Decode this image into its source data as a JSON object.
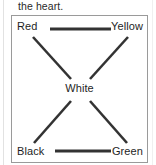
{
  "caption": {
    "text": "the heart."
  },
  "diagram": {
    "line_color": "#333333",
    "border_color": "#9a9a9a",
    "background_color": "#ffffff",
    "nodes": [
      {
        "id": "red",
        "label": "Red",
        "position": "top-left"
      },
      {
        "id": "yellow",
        "label": "Yellow",
        "position": "top-right"
      },
      {
        "id": "white",
        "label": "White",
        "position": "center"
      },
      {
        "id": "black",
        "label": "Black",
        "position": "bottom-left"
      },
      {
        "id": "green",
        "label": "Green",
        "position": "bottom-right"
      }
    ],
    "connections": [
      {
        "from": "red",
        "to": "yellow",
        "style": "horizontal"
      },
      {
        "from": "black",
        "to": "green",
        "style": "horizontal"
      },
      {
        "from": "red",
        "to": "white",
        "style": "diagonal"
      },
      {
        "from": "yellow",
        "to": "white",
        "style": "diagonal"
      },
      {
        "from": "black",
        "to": "white",
        "style": "diagonal"
      },
      {
        "from": "green",
        "to": "white",
        "style": "diagonal"
      }
    ]
  }
}
